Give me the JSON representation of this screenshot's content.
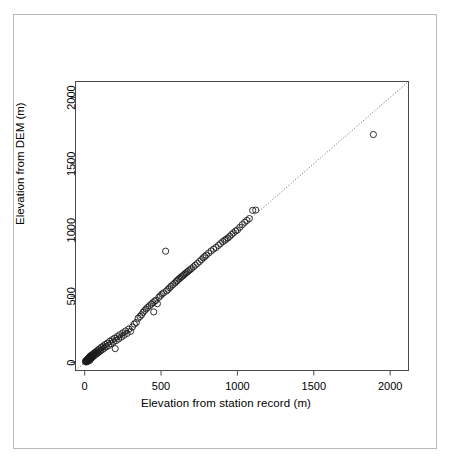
{
  "figure": {
    "border_color": "#b9b9b9",
    "background": "#ffffff",
    "title": ""
  },
  "chart_data": {
    "type": "scatter",
    "title": "",
    "subtitle": "",
    "xlabel": "Elevation from station record (m)",
    "ylabel": "Elevation from DEM (m)",
    "xlim": [
      -60,
      2120
    ],
    "ylim": [
      -60,
      2120
    ],
    "xticks": [
      0,
      500,
      1000,
      1500,
      2000
    ],
    "yticks": [
      0,
      500,
      1000,
      1500,
      2000
    ],
    "xticklabels": [
      "0",
      "500",
      "1000",
      "1500",
      "2000"
    ],
    "yticklabels": [
      "0",
      "500",
      "1000",
      "1500",
      "2000"
    ],
    "grid": false,
    "legend": null,
    "marker": {
      "shape": "open-circle",
      "radius_px": 3.1,
      "stroke": "#1a1a1a",
      "stroke_width": 0.9,
      "fill": "none"
    },
    "reference_line": {
      "kind": "identity",
      "label": "1:1 line",
      "style": "dotted",
      "color": "#555555",
      "width": 0.9,
      "from": [
        -60,
        -60
      ],
      "to": [
        2120,
        2120
      ]
    },
    "series": [
      {
        "name": "stations",
        "points": [
          [
            5,
            8
          ],
          [
            8,
            12
          ],
          [
            10,
            4
          ],
          [
            12,
            18
          ],
          [
            14,
            9
          ],
          [
            16,
            22
          ],
          [
            18,
            14
          ],
          [
            20,
            26
          ],
          [
            22,
            10
          ],
          [
            24,
            30
          ],
          [
            26,
            20
          ],
          [
            28,
            36
          ],
          [
            30,
            24
          ],
          [
            32,
            42
          ],
          [
            34,
            16
          ],
          [
            36,
            48
          ],
          [
            38,
            28
          ],
          [
            40,
            38
          ],
          [
            42,
            52
          ],
          [
            44,
            34
          ],
          [
            46,
            44
          ],
          [
            48,
            58
          ],
          [
            50,
            40
          ],
          [
            54,
            62
          ],
          [
            58,
            48
          ],
          [
            60,
            70
          ],
          [
            64,
            54
          ],
          [
            68,
            74
          ],
          [
            70,
            60
          ],
          [
            74,
            82
          ],
          [
            78,
            66
          ],
          [
            82,
            88
          ],
          [
            86,
            72
          ],
          [
            90,
            96
          ],
          [
            94,
            80
          ],
          [
            98,
            104
          ],
          [
            104,
            88
          ],
          [
            110,
            116
          ],
          [
            116,
            98
          ],
          [
            122,
            124
          ],
          [
            128,
            108
          ],
          [
            134,
            136
          ],
          [
            140,
            118
          ],
          [
            148,
            146
          ],
          [
            156,
            128
          ],
          [
            164,
            160
          ],
          [
            172,
            142
          ],
          [
            180,
            172
          ],
          [
            188,
            154
          ],
          [
            196,
            184
          ],
          [
            200,
            105
          ],
          [
            206,
            166
          ],
          [
            214,
            196
          ],
          [
            222,
            178
          ],
          [
            230,
            210
          ],
          [
            240,
            192
          ],
          [
            250,
            224
          ],
          [
            258,
            206
          ],
          [
            268,
            238
          ],
          [
            278,
            220
          ],
          [
            290,
            252
          ],
          [
            300,
            235
          ],
          [
            312,
            268
          ],
          [
            325,
            290
          ],
          [
            338,
            302
          ],
          [
            350,
            334
          ],
          [
            362,
            348
          ],
          [
            372,
            360
          ],
          [
            382,
            378
          ],
          [
            392,
            392
          ],
          [
            402,
            404
          ],
          [
            412,
            416
          ],
          [
            424,
            428
          ],
          [
            436,
            440
          ],
          [
            446,
            452
          ],
          [
            452,
            382
          ],
          [
            458,
            462
          ],
          [
            466,
            470
          ],
          [
            476,
            444
          ],
          [
            486,
            492
          ],
          [
            496,
            505
          ],
          [
            506,
            516
          ],
          [
            516,
            526
          ],
          [
            530,
            840
          ],
          [
            536,
            540
          ],
          [
            546,
            552
          ],
          [
            556,
            564
          ],
          [
            566,
            576
          ],
          [
            578,
            588
          ],
          [
            590,
            600
          ],
          [
            600,
            612
          ],
          [
            608,
            620
          ],
          [
            616,
            630
          ],
          [
            624,
            636
          ],
          [
            632,
            646
          ],
          [
            640,
            652
          ],
          [
            648,
            660
          ],
          [
            656,
            668
          ],
          [
            664,
            676
          ],
          [
            672,
            684
          ],
          [
            680,
            692
          ],
          [
            690,
            700
          ],
          [
            700,
            710
          ],
          [
            712,
            722
          ],
          [
            724,
            734
          ],
          [
            738,
            748
          ],
          [
            752,
            762
          ],
          [
            764,
            776
          ],
          [
            776,
            790
          ],
          [
            786,
            800
          ],
          [
            796,
            810
          ],
          [
            812,
            826
          ],
          [
            828,
            842
          ],
          [
            844,
            856
          ],
          [
            860,
            868
          ],
          [
            876,
            884
          ],
          [
            890,
            898
          ],
          [
            904,
            912
          ],
          [
            916,
            922
          ],
          [
            926,
            930
          ],
          [
            938,
            940
          ],
          [
            950,
            952
          ],
          [
            962,
            966
          ],
          [
            974,
            978
          ],
          [
            988,
            992
          ],
          [
            1000,
            1000
          ],
          [
            1016,
            1020
          ],
          [
            1032,
            1040
          ],
          [
            1048,
            1058
          ],
          [
            1062,
            1072
          ],
          [
            1078,
            1086
          ],
          [
            1100,
            1148
          ],
          [
            1120,
            1150
          ],
          [
            1890,
            1720
          ]
        ]
      }
    ],
    "annotations": [
      {
        "text": "outlier above line",
        "x": 530,
        "y": 840
      },
      {
        "text": "outlier below line",
        "x": 1890,
        "y": 1720
      }
    ],
    "n_points": 133
  },
  "axes": {
    "box_color": "#4a4a4a",
    "box_width": 1,
    "tick_length_px": 5
  }
}
